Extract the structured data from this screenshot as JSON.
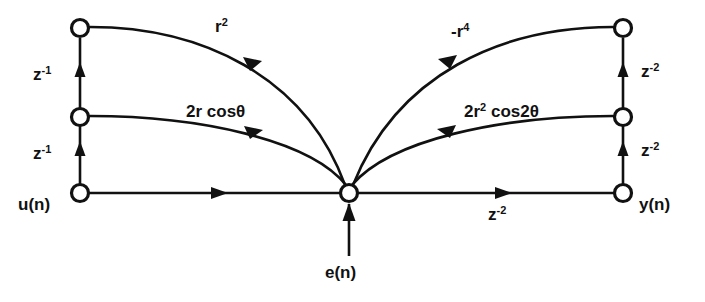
{
  "diagram": {
    "type": "signal-flow-graph",
    "colors": {
      "stroke": "#111111",
      "node_fill": "#ffffff",
      "background": "#ffffff"
    },
    "nodes": [
      {
        "id": "n_left_top",
        "x": 80,
        "y": 28,
        "label": ""
      },
      {
        "id": "n_left_mid",
        "x": 80,
        "y": 117,
        "label": ""
      },
      {
        "id": "n_left_bottom",
        "x": 80,
        "y": 193,
        "label": "u(n)"
      },
      {
        "id": "n_center",
        "x": 349,
        "y": 193,
        "label": ""
      },
      {
        "id": "n_right_top",
        "x": 623,
        "y": 28,
        "label": ""
      },
      {
        "id": "n_right_mid",
        "x": 623,
        "y": 117,
        "label": ""
      },
      {
        "id": "n_right_bottom",
        "x": 623,
        "y": 193,
        "label": "y(n)"
      }
    ],
    "node_labels": {
      "input": "u(n)",
      "output": "y(n)",
      "error": "e(n)"
    },
    "branch_labels": {
      "delay_left_upper": "z",
      "delay_left_upper_exp": "-1",
      "delay_left_lower": "z",
      "delay_left_lower_exp": "-1",
      "delay_right_upper": "z",
      "delay_right_upper_exp": "-2",
      "delay_right_lower": "z",
      "delay_right_lower_exp": "-2",
      "delay_bottom": "z",
      "delay_bottom_exp": "-2",
      "gain_top_left_base": "r",
      "gain_top_left_exp": "2",
      "gain_mid_left": "2r cosθ",
      "gain_top_right_base": "-r",
      "gain_top_right_exp": "4",
      "gain_mid_right_a": "2r",
      "gain_mid_right_exp": "2",
      "gain_mid_right_b": " cos2θ"
    }
  }
}
